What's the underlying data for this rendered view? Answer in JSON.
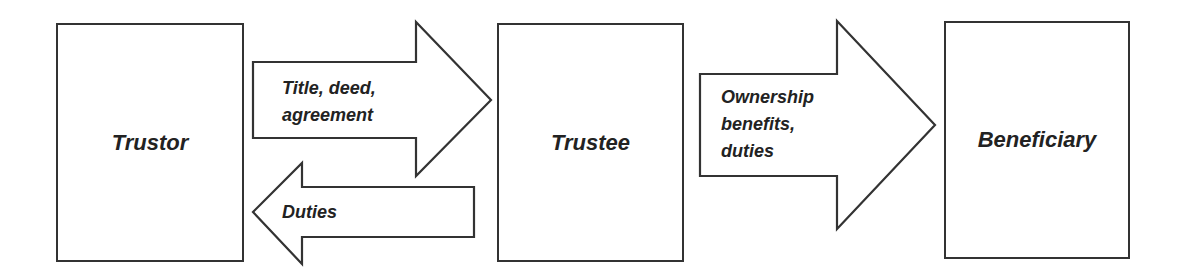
{
  "diagram": {
    "nodes": [
      {
        "id": "trustor",
        "label": "Trustor"
      },
      {
        "id": "trustee",
        "label": "Trustee"
      },
      {
        "id": "beneficiary",
        "label": "Beneficiary"
      }
    ],
    "edges": [
      {
        "from": "trustor",
        "to": "trustee",
        "label": "Title, deed,\nagreement"
      },
      {
        "from": "trustee",
        "to": "trustor",
        "label": "Duties"
      },
      {
        "from": "trustee",
        "to": "beneficiary",
        "label": "Ownership\nbenefits,\nduties"
      }
    ],
    "colors": {
      "stroke": "#333333",
      "text": "#222222",
      "fill": "#ffffff"
    }
  }
}
